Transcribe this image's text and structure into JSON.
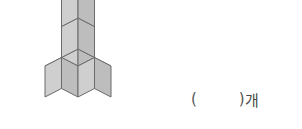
{
  "figure": {
    "name": "isometric-cube-stack",
    "cube_count": 5,
    "cubes": [
      {
        "id": "base-left",
        "gx": 0,
        "gy": 0,
        "gz": 1
      },
      {
        "id": "base-center",
        "gx": 0,
        "gy": 0,
        "gz": 0
      },
      {
        "id": "base-right",
        "gx": 1,
        "gy": 0,
        "gz": 0
      },
      {
        "id": "mid-center",
        "gx": 0,
        "gy": 1,
        "gz": 0
      },
      {
        "id": "top-center",
        "gx": 0,
        "gy": 2,
        "gz": 0
      }
    ],
    "colors": {
      "top_face": "#e3e3e3",
      "left_face": "#cfcfcf",
      "right_face": "#bdbdbd",
      "outline": "#6b6b6b",
      "inner_edge": "#8a8a8a"
    },
    "geometry": {
      "origin_x": 78,
      "origin_y": 80,
      "cube_width": 33,
      "cube_rise": 17,
      "cube_height": 31
    }
  },
  "answer": {
    "open_paren": "(",
    "blank": "",
    "close_paren": ")",
    "unit_label": "개",
    "text": "(        )개"
  }
}
